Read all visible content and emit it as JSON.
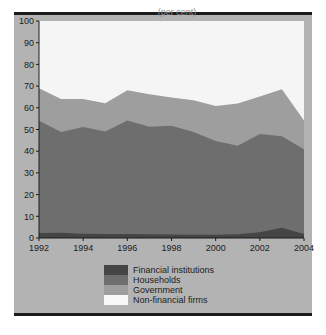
{
  "figure": {
    "background_color": "#b3b3b3",
    "plot_background_color": "#f2f2f2",
    "title_fragment": "(per cent)"
  },
  "chart_data": {
    "type": "area",
    "stacked": true,
    "title": "",
    "xlabel": "",
    "ylabel": "",
    "xlim": [
      1992,
      2004
    ],
    "ylim": [
      0,
      100
    ],
    "grid": false,
    "legend_position": "bottom-center",
    "x": [
      1992,
      1993,
      1994,
      1995,
      1996,
      1997,
      1998,
      1999,
      2000,
      2001,
      2002,
      2003,
      2004
    ],
    "xticks": [
      1992,
      1994,
      1996,
      1998,
      2000,
      2002,
      2004
    ],
    "xtick_labels": [
      "1992",
      "1994",
      "1996",
      "1998",
      "2000",
      "2002",
      "2004"
    ],
    "yticks": [
      0,
      10,
      20,
      30,
      40,
      50,
      60,
      70,
      80,
      90,
      100
    ],
    "ytick_labels": [
      "0",
      "10",
      "20",
      "30",
      "40",
      "50",
      "60",
      "70",
      "80",
      "90",
      "100"
    ],
    "series": [
      {
        "name": "Financial institutions",
        "color": "#454545",
        "values": [
          2.3,
          2.4,
          2.0,
          1.9,
          1.8,
          1.7,
          1.6,
          1.5,
          1.5,
          1.7,
          2.6,
          4.7,
          1.9
        ]
      },
      {
        "name": "Households",
        "color": "#6e6e6e",
        "values": [
          51.7,
          46.4,
          49.1,
          47.2,
          52.3,
          49.6,
          50.1,
          47.3,
          43.2,
          40.8,
          45.3,
          42.2,
          39.0
        ]
      },
      {
        "name": "Government",
        "color": "#9e9e9e",
        "values": [
          15.0,
          15.2,
          12.9,
          13.0,
          14.0,
          15.0,
          13.1,
          14.7,
          16.1,
          19.5,
          17.3,
          21.6,
          13.2
        ]
      },
      {
        "name": "Non-financial firms",
        "color": "#f5f5f5",
        "values": [
          31.0,
          36.0,
          36.0,
          37.9,
          31.9,
          33.7,
          35.2,
          36.5,
          39.2,
          38.0,
          34.8,
          31.5,
          45.9
        ]
      }
    ],
    "cumulative_boundaries": {
      "financial_institutions_top": [
        2.3,
        2.4,
        2.0,
        1.9,
        1.8,
        1.7,
        1.6,
        1.5,
        1.5,
        1.7,
        2.6,
        4.7,
        1.9
      ],
      "households_top": [
        54.0,
        48.8,
        51.1,
        49.1,
        54.1,
        51.3,
        51.7,
        48.8,
        44.7,
        42.5,
        47.9,
        46.9,
        40.9
      ],
      "government_top": [
        69.0,
        64.0,
        64.0,
        62.1,
        68.1,
        66.3,
        64.8,
        63.5,
        60.8,
        62.0,
        65.2,
        68.5,
        54.1
      ]
    }
  },
  "legend": {
    "items": [
      {
        "label": "Financial institutions",
        "color": "#454545"
      },
      {
        "label": "Households",
        "color": "#6e6e6e"
      },
      {
        "label": "Government",
        "color": "#9e9e9e"
      },
      {
        "label": "Non-financial firms",
        "color": "#f8f8f8"
      }
    ]
  }
}
